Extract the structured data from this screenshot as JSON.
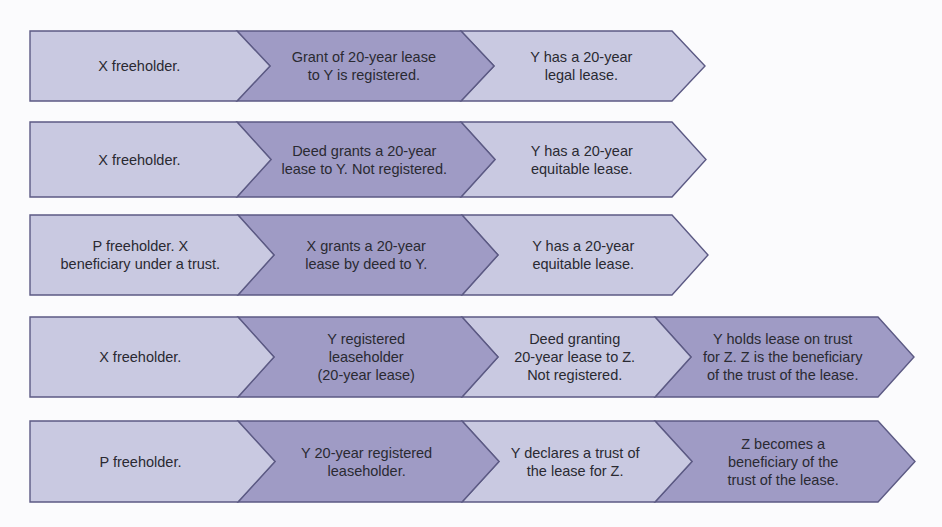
{
  "colors": {
    "light": "#c9c9e1",
    "dark": "#9f9bc5",
    "border": "#5c5a84",
    "text": "#2a2a32",
    "background": "#fbfbfd"
  },
  "rows": [
    {
      "segments": [
        {
          "text": "X freeholder.",
          "shade": "light"
        },
        {
          "text": "Grant of 20-year lease\nto Y is registered.",
          "shade": "dark"
        },
        {
          "text": "Y has a 20-year\nlegal lease.",
          "shade": "light"
        }
      ]
    },
    {
      "segments": [
        {
          "text": "X freeholder.",
          "shade": "light"
        },
        {
          "text": "Deed grants a 20-year\nlease to Y. Not registered.",
          "shade": "dark"
        },
        {
          "text": "Y has a 20-year\nequitable lease.",
          "shade": "light"
        }
      ]
    },
    {
      "segments": [
        {
          "text": "P freeholder. X\nbeneficiary under a trust.",
          "shade": "light"
        },
        {
          "text": "X grants a 20-year\nlease by deed to Y.",
          "shade": "dark"
        },
        {
          "text": "Y has a 20-year\nequitable lease.",
          "shade": "light"
        }
      ]
    },
    {
      "segments": [
        {
          "text": "X freeholder.",
          "shade": "light"
        },
        {
          "text": "Y registered\nleaseholder\n(20-year lease)",
          "shade": "dark"
        },
        {
          "text": "Deed granting\n20-year lease to Z.\nNot registered.",
          "shade": "light"
        },
        {
          "text": "Y holds lease on trust\nfor Z. Z is the beneficiary\nof the trust of the lease.",
          "shade": "dark"
        }
      ]
    },
    {
      "segments": [
        {
          "text": "P freeholder.",
          "shade": "light"
        },
        {
          "text": "Y 20-year registered\nleaseholder.",
          "shade": "dark"
        },
        {
          "text": "Y declares a trust of\nthe lease for Z.",
          "shade": "light"
        },
        {
          "text": "Z becomes a\nbeneficiary of the\ntrust of the lease.",
          "shade": "dark"
        }
      ]
    }
  ]
}
